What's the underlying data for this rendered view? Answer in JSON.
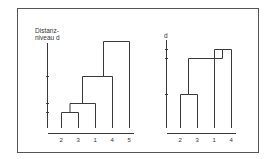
{
  "figure": {
    "left_dendrogram": {
      "y_label_line1": "Distanz-",
      "y_label_line2": "niveau d",
      "leaves": [
        "2",
        "3",
        "1",
        "4",
        "5"
      ],
      "merges": [
        {
          "join": [
            "2",
            "3"
          ],
          "level": 1
        },
        {
          "join": [
            "(2,3)",
            "1"
          ],
          "level": 2
        },
        {
          "join": [
            "(2,3,1)",
            "4"
          ],
          "level": 3
        },
        {
          "join": [
            "(2,3,1,4)",
            "5"
          ],
          "level": 4
        }
      ]
    },
    "right_dendrogram": {
      "y_label": "d",
      "leaves": [
        "2",
        "3",
        "1",
        "4"
      ],
      "merges": [
        {
          "join": [
            "2",
            "3"
          ],
          "level": 1
        },
        {
          "join": [
            "1",
            "4"
          ],
          "level": 3
        },
        {
          "join": [
            "(2,3)",
            "(1,4)"
          ],
          "level": 2.6,
          "note": "inversion"
        }
      ]
    }
  }
}
